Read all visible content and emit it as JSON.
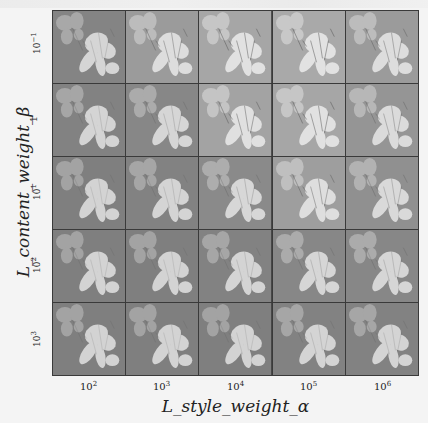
{
  "figure": {
    "x_axis_title": "L_style_weight_α",
    "y_axis_title": "L_content_weight_β",
    "x_ticks": [
      {
        "base": "10",
        "exp": "2"
      },
      {
        "base": "10",
        "exp": "3"
      },
      {
        "base": "10",
        "exp": "4"
      },
      {
        "base": "10",
        "exp": "5"
      },
      {
        "base": "10",
        "exp": "6"
      }
    ],
    "y_ticks": [
      {
        "base": "10",
        "exp": "−1"
      },
      {
        "base": "1",
        "exp": ""
      },
      {
        "base": "10",
        "exp": "1"
      },
      {
        "base": "10",
        "exp": "2"
      },
      {
        "base": "10",
        "exp": "3"
      }
    ],
    "cell_content": "grayscale iris flower (style transfer output)",
    "style_intensity": [
      [
        0.15,
        0.55,
        0.75,
        0.8,
        0.55
      ],
      [
        0.1,
        0.2,
        0.7,
        0.75,
        0.45
      ],
      [
        0.05,
        0.1,
        0.25,
        0.6,
        0.35
      ],
      [
        0.05,
        0.05,
        0.1,
        0.2,
        0.2
      ],
      [
        0.05,
        0.05,
        0.05,
        0.1,
        0.1
      ]
    ],
    "colors": {
      "background": "#f4f4f4",
      "grid_line": "#3a3a3a",
      "cell_bg_dark": "#7c7c7c",
      "cell_bg_light": "#b4b4b4",
      "flower_light": "#e6e6e6"
    }
  }
}
